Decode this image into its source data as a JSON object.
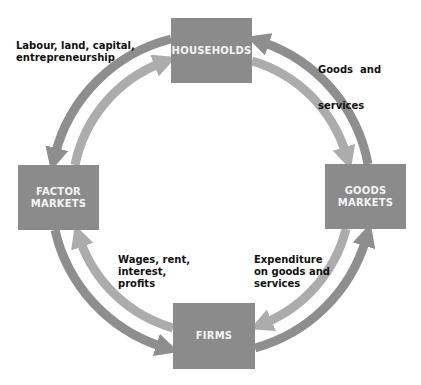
{
  "colors": {
    "box_fill": "#8b8b8b",
    "box_text": "#f4f4f4",
    "outer_arrow": "#8e8e8e",
    "inner_arrow": "#acacac",
    "label_text": "#111111"
  },
  "nodes": {
    "households": {
      "label": "HOUSEHOLDS"
    },
    "factor_markets": {
      "line1": "FACTOR",
      "line2": "MARKETS"
    },
    "goods_markets": {
      "line1": "GOODS",
      "line2": "MARKETS"
    },
    "firms": {
      "label": "FIRMS"
    }
  },
  "flows": {
    "factors_of_production": {
      "line1": "Labour, land, capital,",
      "line2": "entrepreneurship"
    },
    "goods_and_services": {
      "line1": "Goods  and",
      "line2": "services"
    },
    "factor_incomes": {
      "line1": "Wages, rent,",
      "line2": "interest,",
      "line3": "profits"
    },
    "expenditure": {
      "line1": "Expenditure",
      "line2": "on goods and",
      "line3": "services"
    }
  },
  "arrows": [
    {
      "from": "households",
      "to": "factor_markets",
      "ring": "outer"
    },
    {
      "from": "factor_markets",
      "to": "households",
      "ring": "inner"
    },
    {
      "from": "goods_markets",
      "to": "households",
      "ring": "outer"
    },
    {
      "from": "households",
      "to": "goods_markets",
      "ring": "inner"
    },
    {
      "from": "factor_markets",
      "to": "firms",
      "ring": "outer"
    },
    {
      "from": "firms",
      "to": "factor_markets",
      "ring": "inner"
    },
    {
      "from": "firms",
      "to": "goods_markets",
      "ring": "outer"
    },
    {
      "from": "goods_markets",
      "to": "firms",
      "ring": "inner"
    }
  ]
}
